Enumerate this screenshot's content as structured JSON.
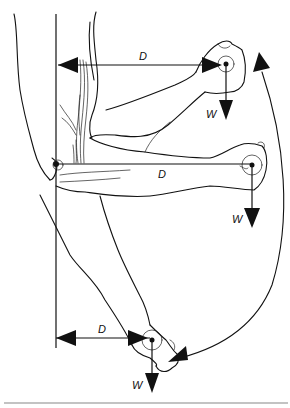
{
  "diagram": {
    "type": "biomechanics-illustration",
    "positions": [
      {
        "id": "raised",
        "distance_label": "D",
        "weight_label": "W"
      },
      {
        "id": "horizontal",
        "distance_label": "D",
        "weight_label": "W"
      },
      {
        "id": "lowered",
        "distance_label": "D",
        "weight_label": "W"
      }
    ],
    "colors": {
      "ink": "#111111",
      "background": "#ffffff",
      "rule": "#888888"
    }
  }
}
